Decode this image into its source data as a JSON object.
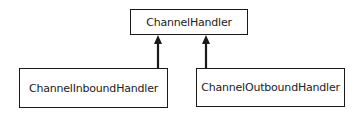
{
  "diagram": {
    "type": "class-hierarchy",
    "nodes": [
      {
        "id": "channel-handler",
        "label": "ChannelHandler"
      },
      {
        "id": "channel-inbound-handler",
        "label": "ChannelInboundHandler"
      },
      {
        "id": "channel-outbound-handler",
        "label": "ChannelOutboundHandler"
      }
    ],
    "edges": [
      {
        "from": "channel-inbound-handler",
        "to": "channel-handler",
        "style": "solid-arrow"
      },
      {
        "from": "channel-outbound-handler",
        "to": "channel-handler",
        "style": "solid-arrow"
      }
    ],
    "colors": {
      "stroke": "#1a1a1a",
      "text": "#222222",
      "background": "#ffffff"
    }
  }
}
